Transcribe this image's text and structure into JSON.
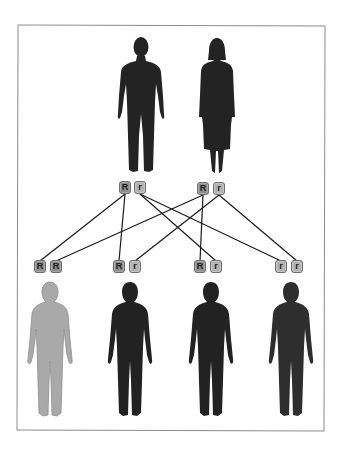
{
  "diagram": {
    "title": "",
    "parents": [
      {
        "id": "father",
        "role": "father",
        "alleles": [
          "R",
          "r"
        ],
        "fill": "#232323"
      },
      {
        "id": "mother",
        "role": "mother",
        "alleles": [
          "R",
          "r"
        ],
        "fill": "#232323"
      }
    ],
    "offspring": [
      {
        "id": "child1",
        "alleles": [
          "R",
          "R"
        ],
        "fill": "#a9a9a9"
      },
      {
        "id": "child2",
        "alleles": [
          "R",
          "r"
        ],
        "fill": "#222222"
      },
      {
        "id": "child3",
        "alleles": [
          "R",
          "r"
        ],
        "fill": "#222222"
      },
      {
        "id": "child4",
        "alleles": [
          "r",
          "r"
        ],
        "fill": "#2e2e2e"
      }
    ],
    "connections": [
      {
        "from": "father.R",
        "to": "child1.0"
      },
      {
        "from": "father.R",
        "to": "child2.0"
      },
      {
        "from": "father.r",
        "to": "child3.1"
      },
      {
        "from": "father.r",
        "to": "child4.0"
      },
      {
        "from": "mother.R",
        "to": "child1.1"
      },
      {
        "from": "mother.R",
        "to": "child3.0"
      },
      {
        "from": "mother.r",
        "to": "child2.1"
      },
      {
        "from": "mother.r",
        "to": "child4.1"
      }
    ],
    "colors": {
      "dominant_allele": "#8d8d8d",
      "recessive_allele": "#b3b3b3",
      "line": "#1a1a1a",
      "frame_border": "#8c8c8c"
    }
  }
}
